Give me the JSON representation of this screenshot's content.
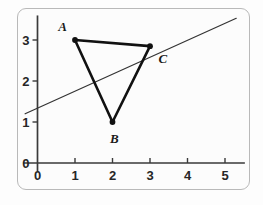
{
  "figure": {
    "background_color": "#fcfcfc",
    "border_color": "#b9b9b9",
    "axis_color": "#3a3a3a",
    "shape_color": "#111111",
    "line_color": "#333333"
  },
  "chart_data": {
    "type": "scatter",
    "title": "",
    "xlabel": "",
    "ylabel": "",
    "xlim": [
      -0.35,
      5.45
    ],
    "ylim": [
      -0.35,
      3.55
    ],
    "grid": false,
    "legend": null,
    "x_ticks": [
      0,
      1,
      2,
      3,
      4,
      5
    ],
    "x_tick_labels": [
      "0",
      "1",
      "2",
      "3",
      "4",
      "5"
    ],
    "y_ticks": [
      0,
      1,
      2,
      3
    ],
    "y_tick_labels": [
      "0",
      "1",
      "2",
      "3"
    ],
    "origin_label": "0",
    "points": [
      {
        "label": "A",
        "x": 1,
        "y": 3,
        "label_dx": -0.33,
        "label_dy": 0.34
      },
      {
        "label": "B",
        "x": 2,
        "y": 1,
        "label_dx": 0.05,
        "label_dy": -0.38
      },
      {
        "label": "C",
        "x": 3,
        "y": 2.85,
        "label_dx": 0.34,
        "label_dy": -0.28
      }
    ],
    "polygon": {
      "name": "triangle-ABC",
      "vertices": [
        "A",
        "B",
        "C"
      ],
      "closed": true,
      "stroke_width": 2.6
    },
    "lines": [
      {
        "name": "diagonal-line",
        "x1": -0.33,
        "y1": 1.2,
        "x2": 5.3,
        "y2": 3.53,
        "stroke_width": 1.2
      }
    ]
  }
}
